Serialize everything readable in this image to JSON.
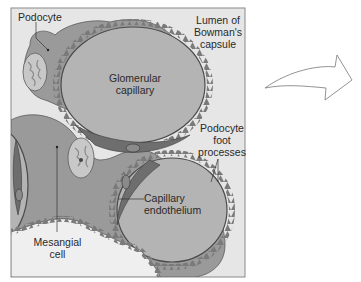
{
  "diagram": {
    "labels": {
      "podocyte": "Podocyte",
      "lumen": [
        "Lumen of",
        "Bowman's",
        "capsule"
      ],
      "glomerular_capillary": [
        "Glomerular",
        "capillary"
      ],
      "podocyte_foot_processes": [
        "Podocyte",
        "foot",
        "processes"
      ],
      "capillary_endothelium": [
        "Capillary",
        "endothelium"
      ],
      "mesangial_cell": [
        "Mesangial",
        "cell"
      ]
    },
    "colors": {
      "background": "#e6e6e6",
      "frame": "#8a8a8a",
      "cell_body": "#9a9a9a",
      "capillary_lumen": "#b4b4b4",
      "endothelium": "#6e6e6e",
      "outline": "#4a4a4a",
      "arrow_fill": "#ffffff",
      "arrow_stroke": "#777777"
    }
  }
}
